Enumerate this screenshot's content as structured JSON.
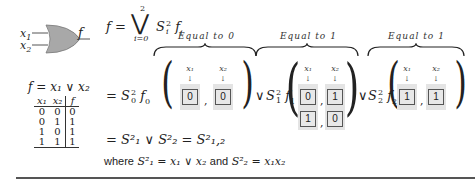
{
  "gate": {
    "type": "OR gate",
    "input1": "x",
    "input1_sub": "1",
    "input2": "x",
    "input2_sub": "2",
    "output": "f",
    "fill_color": "#a8a8a8"
  },
  "function_def": "f = x₁ ∨ x₂",
  "truth_table": {
    "headers": [
      "x₁",
      "x₂",
      "f"
    ],
    "rows": [
      [
        "0",
        "0",
        "0"
      ],
      [
        "0",
        "1",
        "1"
      ],
      [
        "1",
        "0",
        "1"
      ],
      [
        "1",
        "1",
        "1"
      ]
    ]
  },
  "equations": {
    "top": {
      "lhs": "f =",
      "operator": "⋁",
      "upper": "2",
      "lower": "i=0",
      "term": "S",
      "term_sup": "2",
      "term_sub": "i",
      "f": "f",
      "f_sub": "i"
    },
    "expansion": {
      "eq_sign": "=",
      "or_symbol": "∨",
      "groups": [
        {
          "label": "Equal to 0",
          "S_sub": "0",
          "f_sub": "0",
          "col_headers": [
            "x₁",
            "x₂"
          ],
          "rows": [
            [
              "0",
              "0"
            ]
          ]
        },
        {
          "label": "Equal to 1",
          "S_sub": "1",
          "f_sub": "1",
          "col_headers": [
            "x₁",
            "x₂"
          ],
          "rows": [
            [
              "0",
              "1"
            ],
            [
              "1",
              "0"
            ]
          ]
        },
        {
          "label": "Equal to 1",
          "S_sub": "2",
          "f_sub": "2",
          "col_headers": [
            "x₁",
            "x₂"
          ],
          "rows": [
            [
              "1",
              "1"
            ]
          ]
        }
      ]
    },
    "result": "= S²₁  ∨  S²₂ = S²₁,₂",
    "where_word": "where",
    "where_def1": "S²₁ = x₁ ∨ x₂",
    "and_word": "and",
    "where_def2": "S²₂ = x₁x₂"
  },
  "arrow_glyph": "↓",
  "comma": ","
}
